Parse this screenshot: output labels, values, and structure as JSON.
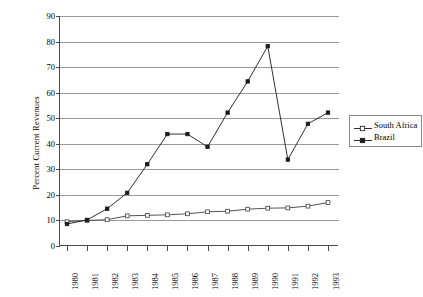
{
  "chart_data": {
    "type": "line",
    "title": "",
    "xlabel": "",
    "ylabel": "Percent Current Revenues",
    "categories": [
      "1980",
      "1981",
      "1982",
      "1983",
      "1984",
      "1985",
      "1986",
      "1987",
      "1988",
      "1989",
      "1990",
      "1991",
      "1992",
      "1993"
    ],
    "x": [
      1980,
      1981,
      1982,
      1983,
      1984,
      1985,
      1986,
      1987,
      1988,
      1989,
      1990,
      1991,
      1992,
      1993
    ],
    "ylim": [
      0,
      90
    ],
    "ytick_values": [
      0,
      10,
      20,
      30,
      40,
      50,
      60,
      70,
      80,
      90
    ],
    "ytick_labels": [
      "0",
      "10",
      "20",
      "30",
      "40",
      "50",
      "60",
      "70",
      "80",
      "90"
    ],
    "grid": "horizontal",
    "legend_position": "right",
    "series": [
      {
        "name": "South Africa",
        "marker": "open-square",
        "color": "#404040",
        "values": [
          9.5,
          10.0,
          10.3,
          11.8,
          12.0,
          12.2,
          12.6,
          13.4,
          13.6,
          14.4,
          14.8,
          14.9,
          15.6,
          17.0
        ]
      },
      {
        "name": "Brazil",
        "marker": "filled-square",
        "color": "#1a1a1a",
        "values": [
          8.6,
          10.2,
          14.6,
          20.8,
          32.0,
          43.8,
          43.8,
          38.8,
          52.2,
          64.4,
          78.2,
          33.8,
          47.8,
          52.2
        ]
      }
    ]
  },
  "axis": {
    "y_title": "Percent Current Revenues"
  },
  "legend": {
    "items": [
      {
        "label": "South Africa",
        "marker": "open-square"
      },
      {
        "label": "Brazil",
        "marker": "filled-square"
      }
    ]
  }
}
